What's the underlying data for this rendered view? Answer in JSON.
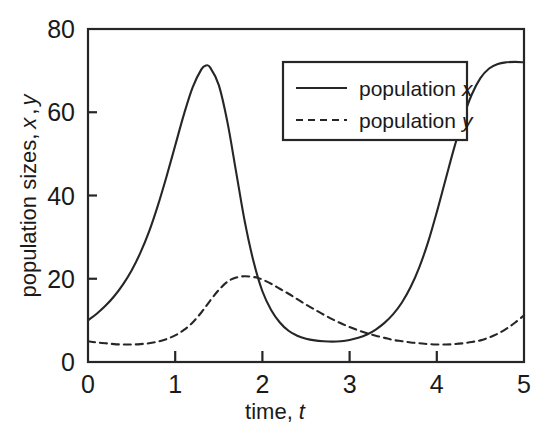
{
  "chart_data": {
    "type": "line",
    "title": "",
    "xlabel": "time, t",
    "xlabel_main": "time,",
    "xlabel_italic": "t",
    "ylabel": "population sizes, x , y",
    "ylabel_main": "population sizes,",
    "ylabel_italic_1": "x",
    "ylabel_comma": ",",
    "ylabel_italic_2": "y",
    "xlim": [
      0,
      5
    ],
    "ylim": [
      0,
      80
    ],
    "xticks": [
      "0",
      "1",
      "2",
      "3",
      "4",
      "5"
    ],
    "xtick_values": [
      0,
      1,
      2,
      3,
      4,
      5
    ],
    "yticks": [
      "0",
      "20",
      "40",
      "60",
      "80"
    ],
    "ytick_values": [
      0,
      20,
      40,
      60,
      80
    ],
    "grid": false,
    "legend_position": "upper right",
    "legend": [
      {
        "name": "population x",
        "label_main": "population",
        "label_italic": "x",
        "style": "solid"
      },
      {
        "name": "population y",
        "label_main": "population",
        "label_italic": "y",
        "style": "dashed"
      }
    ],
    "series": [
      {
        "name": "population x",
        "style": "solid",
        "x": [
          0.0,
          0.1,
          0.2,
          0.3,
          0.4,
          0.5,
          0.6,
          0.7,
          0.8,
          0.9,
          1.0,
          1.1,
          1.2,
          1.3,
          1.35,
          1.4,
          1.5,
          1.6,
          1.7,
          1.8,
          1.9,
          2.0,
          2.1,
          2.2,
          2.3,
          2.4,
          2.5,
          2.6,
          2.7,
          2.8,
          2.9,
          3.0,
          3.1,
          3.2,
          3.3,
          3.4,
          3.5,
          3.6,
          3.7,
          3.8,
          3.9,
          4.0,
          4.1,
          4.2,
          4.3,
          4.4,
          4.5,
          4.6,
          4.7,
          4.8,
          4.9,
          5.0
        ],
        "y": [
          10.0,
          11.6,
          13.5,
          15.8,
          18.6,
          22.0,
          26.2,
          31.3,
          37.5,
          44.5,
          52.0,
          59.5,
          66.0,
          70.3,
          71.2,
          70.8,
          66.5,
          57.5,
          45.5,
          33.5,
          24.0,
          17.0,
          12.5,
          9.5,
          7.5,
          6.3,
          5.6,
          5.2,
          5.0,
          4.9,
          5.0,
          5.3,
          5.8,
          6.6,
          7.8,
          9.4,
          11.5,
          14.3,
          18.0,
          22.8,
          28.8,
          36.0,
          43.8,
          51.5,
          58.5,
          64.2,
          68.2,
          70.5,
          71.6,
          72.0,
          72.1,
          72.0
        ]
      },
      {
        "name": "population y",
        "style": "dashed",
        "x": [
          0.0,
          0.1,
          0.2,
          0.3,
          0.4,
          0.5,
          0.6,
          0.7,
          0.8,
          0.9,
          1.0,
          1.1,
          1.2,
          1.3,
          1.4,
          1.5,
          1.6,
          1.7,
          1.8,
          1.9,
          1.95,
          2.0,
          2.1,
          2.2,
          2.3,
          2.4,
          2.5,
          2.6,
          2.7,
          2.8,
          2.9,
          3.0,
          3.1,
          3.2,
          3.3,
          3.4,
          3.5,
          3.6,
          3.7,
          3.8,
          3.9,
          4.0,
          4.1,
          4.2,
          4.3,
          4.4,
          4.5,
          4.6,
          4.7,
          4.8,
          4.9,
          5.0
        ],
        "y": [
          5.0,
          4.7,
          4.5,
          4.3,
          4.2,
          4.2,
          4.3,
          4.5,
          4.9,
          5.5,
          6.4,
          7.7,
          9.5,
          11.9,
          14.7,
          17.3,
          19.3,
          20.3,
          20.6,
          20.4,
          20.2,
          19.8,
          18.8,
          17.6,
          16.4,
          15.1,
          13.8,
          12.6,
          11.4,
          10.3,
          9.3,
          8.4,
          7.6,
          6.9,
          6.3,
          5.8,
          5.3,
          5.0,
          4.7,
          4.5,
          4.3,
          4.2,
          4.2,
          4.3,
          4.5,
          4.8,
          5.2,
          5.9,
          6.8,
          8.0,
          9.5,
          11.2
        ]
      }
    ],
    "annotations": [
      {
        "text": "peak of population x",
        "t": 1.35,
        "value": 71.2
      },
      {
        "text": "peak of population y",
        "t": 1.85,
        "value": 20.6
      },
      {
        "text": "trough of population x",
        "t": 2.8,
        "value": 4.9
      }
    ],
    "colors": {
      "line": "#262626",
      "background": "#ffffff",
      "text": "#1a1a1a"
    },
    "plot_area": {
      "left": 88,
      "right": 524,
      "top": 29,
      "bottom": 362
    }
  }
}
